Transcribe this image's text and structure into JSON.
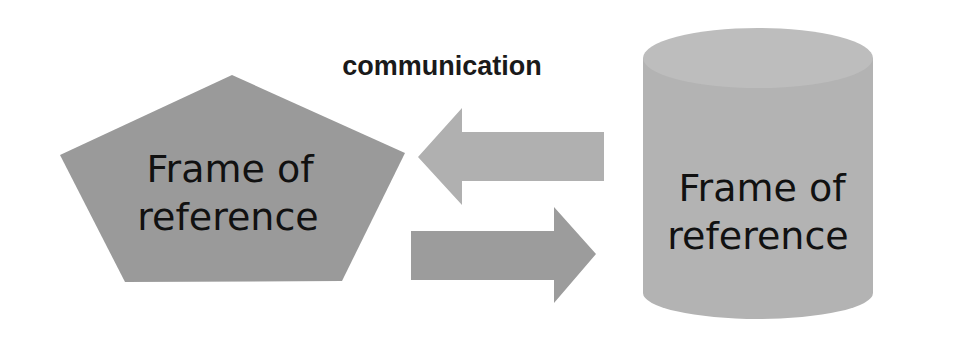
{
  "diagram": {
    "title": "communication",
    "left_shape": {
      "type": "pentagon",
      "line1": "Frame of",
      "line2": "reference",
      "fill": "#9a9a9a"
    },
    "right_shape": {
      "type": "cylinder",
      "line1": "Frame of",
      "line2": "reference",
      "fill": "#b3b3b3",
      "top_fill": "#bdbdbd"
    },
    "arrows": [
      {
        "direction": "left",
        "fill": "#b0b0b0"
      },
      {
        "direction": "right",
        "fill": "#9c9c9c"
      }
    ]
  }
}
